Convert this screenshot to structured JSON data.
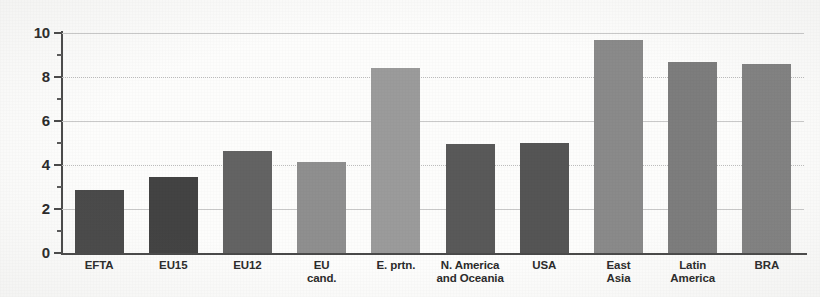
{
  "chart_data": {
    "type": "bar",
    "title": "",
    "subtitle": "",
    "xlabel": "",
    "ylabel": "",
    "ylim": [
      0,
      10
    ],
    "ytick_values": [
      0,
      2,
      4,
      6,
      8,
      10
    ],
    "ytick_labels": [
      "0",
      "2",
      "4",
      "6",
      "8",
      "10"
    ],
    "yminor_ticks": [
      1,
      3,
      5,
      7,
      9
    ],
    "grid": true,
    "grid_axis": "y",
    "legend": false,
    "legend_position": "none",
    "categories": [
      "EFTA",
      "EU15",
      "EU12",
      "EU cand.",
      "E. prtn.",
      "N. America and Oceania",
      "USA",
      "East Asia",
      "Latin America",
      "BRA"
    ],
    "category_label_lines": [
      [
        "EFTA"
      ],
      [
        "EU15"
      ],
      [
        "EU12"
      ],
      [
        "EU",
        "cand."
      ],
      [
        "E. prtn."
      ],
      [
        "N. America",
        "and Oceania"
      ],
      [
        "USA"
      ],
      [
        "East",
        "Asia"
      ],
      [
        "Latin",
        "America"
      ],
      [
        "BRA"
      ]
    ],
    "values": [
      2.85,
      3.45,
      4.65,
      4.15,
      8.4,
      4.95,
      5.0,
      9.7,
      8.7,
      8.6
    ],
    "bar_colors": [
      "#4a4a4a",
      "#434343",
      "#636363",
      "#8f8f8f",
      "#9b9b9b",
      "#595959",
      "#555555",
      "#8a8a8a",
      "#7d7d7d",
      "#828282"
    ]
  },
  "axes": {
    "axis_color": "#4a4a4a",
    "gridline_color": "#c9c9c9",
    "background_color": "#fdfdfc"
  }
}
